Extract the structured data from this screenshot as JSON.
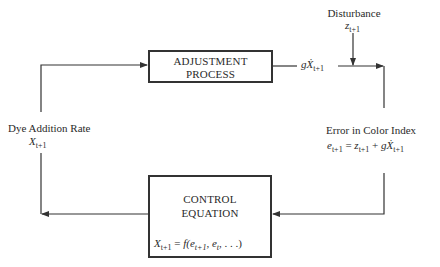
{
  "diagram": {
    "blocks": {
      "adjustment": {
        "line1": "ADJUSTMENT",
        "line2": "PROCESS"
      },
      "control": {
        "line1": "CONTROL",
        "line2": "EQUATION",
        "formula": {
          "lhs": "X",
          "lhs_sub": "t+1",
          "eq": "=",
          "f": "f(",
          "e1": "e",
          "e1_sub": "t+1",
          "sep": ", ",
          "e2": "e",
          "e2_sub": "t",
          "tail": ", . . .)"
        }
      }
    },
    "labels": {
      "disturbance": {
        "text": "Disturbance",
        "sym": "z",
        "sub": "t+1"
      },
      "process_output": {
        "g": "g",
        "sym": "Ẋ",
        "sub": "t+1"
      },
      "error": {
        "text": "Error in Color Index",
        "eq": {
          "e": "e",
          "e_sub": "t+1",
          "eq": "=",
          "z": "z",
          "z_sub": "t+1",
          "plus": "+",
          "g": "g",
          "x": "Ẋ",
          "x_sub": "t+1"
        }
      },
      "dye_rate": {
        "text": "Dye Addition Rate",
        "sym": "X",
        "sub": "t+1"
      }
    },
    "colors": {
      "line": "#333333",
      "text": "#2a2a2a",
      "background": "#ffffff"
    }
  }
}
